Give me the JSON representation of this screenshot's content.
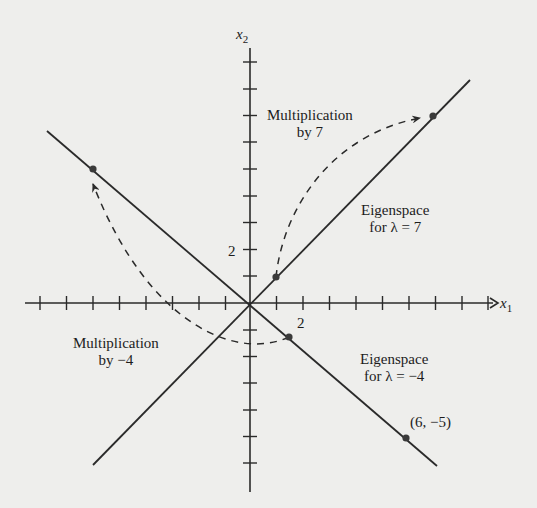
{
  "diagram": {
    "type": "eigenspace-plot",
    "axes": {
      "x_label": "x",
      "x_sub": "1",
      "y_label": "x",
      "y_sub": "2",
      "unit_px": 26.7,
      "origin_px": [
        250,
        303
      ],
      "x_tick_label": "2",
      "y_tick_label": "2"
    },
    "eigenspaces": [
      {
        "title": "Eigenspace",
        "subtitle": "for λ = 7",
        "direction": [
          1,
          1
        ]
      },
      {
        "title": "Eigenspace",
        "subtitle": "for λ = −4",
        "direction": [
          6,
          -5
        ]
      }
    ],
    "transformations": [
      {
        "title": "Multiplication",
        "subtitle": "by 7",
        "from": [
          1,
          1
        ],
        "to": [
          7,
          7
        ]
      },
      {
        "title": "Multiplication",
        "subtitle": "by −4",
        "from": [
          1.5,
          -1.25
        ],
        "to": [
          -6,
          5
        ]
      }
    ],
    "points": [
      {
        "x": 1,
        "y": 1
      },
      {
        "x": 7,
        "y": 7
      },
      {
        "x": 1.5,
        "y": -1.25
      },
      {
        "x": -6,
        "y": 5
      },
      {
        "x": 6,
        "y": -5,
        "label": "(6, −5)"
      }
    ],
    "colors": {
      "ink": "#2a2a2a",
      "paper": "#eeeeec"
    }
  }
}
